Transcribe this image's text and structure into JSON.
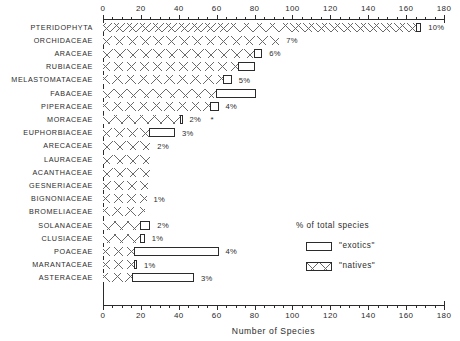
{
  "chart_data": {
    "type": "bar",
    "orientation": "horizontal",
    "stacked": true,
    "title": "",
    "xlabel": "Number of Species",
    "ylabel": "",
    "xlim": [
      0,
      180
    ],
    "xticks": [
      0,
      20,
      40,
      60,
      80,
      100,
      120,
      140,
      160,
      180
    ],
    "xtick_labels": [
      "0",
      "20",
      "40",
      "60",
      "80",
      "100",
      "120",
      "140",
      "160",
      "180"
    ],
    "minor_tick_interval": 5,
    "grid": false,
    "legend_position": "lower-right-inside",
    "categories": [
      "PTERIDOPHYTA",
      "ORCHIDACEAE",
      "ARACEAE",
      "RUBIACEAE",
      "MELASTOMATACEAE",
      "FABACEAE",
      "PIPERACEAE",
      "MORACEAE",
      "EUPHORBIACEAE",
      "ARECACEAE",
      "LAURACEAE",
      "ACANTHACEAE",
      "GESNERIACEAE",
      "BIGNONIACEAE",
      "BROMELIACEAE",
      "SOLANACEAE",
      "CLUSIACEAE",
      "POACEAE",
      "MARANTACEAE",
      "ASTERACEAE"
    ],
    "series": [
      {
        "name": "\"natives\"",
        "values": [
          166,
          93,
          80,
          72,
          64,
          60,
          57,
          41,
          25,
          25,
          25,
          25,
          24,
          23,
          22,
          20,
          20,
          17,
          17,
          16
        ]
      },
      {
        "name": "\"exotics\"",
        "values": [
          2,
          0,
          4,
          8,
          4,
          21,
          4,
          1,
          13,
          0,
          0,
          0,
          0,
          0,
          0,
          5,
          2,
          44,
          1,
          32
        ]
      }
    ],
    "totals": [
      168,
      93,
      84,
      80,
      68,
      81,
      61,
      42,
      38,
      25,
      25,
      25,
      24,
      23,
      22,
      25,
      22,
      61,
      18,
      48
    ],
    "pct_of_total_species": [
      "10%",
      "7%",
      "6%",
      "",
      "5%",
      "",
      "4%",
      "2%",
      "3%",
      "2%",
      "",
      "",
      "",
      "1%",
      "",
      "2%",
      "1%",
      "4%",
      "1%",
      "3%"
    ],
    "annotations": [
      {
        "category": "MORACEAE",
        "marker": "*"
      }
    ]
  },
  "legend": {
    "title": "% of total species",
    "items": [
      {
        "label": "\"exotics\"",
        "swatch": "open"
      },
      {
        "label": "\"natives\"",
        "swatch": "hatched"
      }
    ]
  }
}
